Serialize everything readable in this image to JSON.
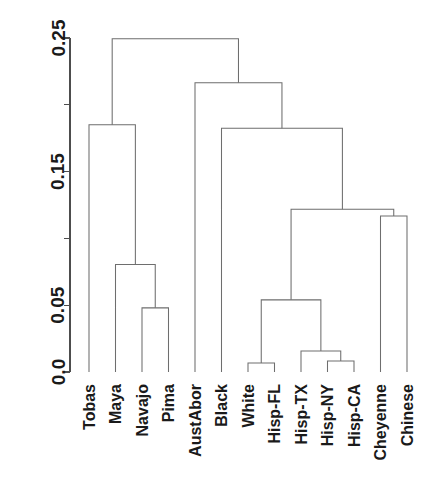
{
  "chart_data": {
    "type": "dendrogram",
    "title": "",
    "xlabel": "",
    "ylabel": "",
    "ylim": [
      0.0,
      0.25
    ],
    "grid": false,
    "legend": null,
    "orientation": "vertical",
    "y_ticks": [
      {
        "value": 0.0,
        "label": "0.0"
      },
      {
        "value": 0.05,
        "label": "0.05"
      },
      {
        "value": 0.1,
        "label": ""
      },
      {
        "value": 0.15,
        "label": "0.15"
      },
      {
        "value": 0.2,
        "label": ""
      },
      {
        "value": 0.25,
        "label": "0.25"
      }
    ],
    "tick_labels": [
      "0.0",
      "0.05",
      "0.15",
      "0.25"
    ],
    "leaves": [
      {
        "index": 0,
        "label": "Tobas"
      },
      {
        "index": 1,
        "label": "Maya"
      },
      {
        "index": 2,
        "label": "Navajo"
      },
      {
        "index": 3,
        "label": "Pima"
      },
      {
        "index": 4,
        "label": "AustAbor"
      },
      {
        "index": 5,
        "label": "Black"
      },
      {
        "index": 6,
        "label": "White"
      },
      {
        "index": 7,
        "label": "Hisp-FL"
      },
      {
        "index": 8,
        "label": "Hisp-TX"
      },
      {
        "index": 9,
        "label": "Hisp-NY"
      },
      {
        "index": 10,
        "label": "Hisp-CA"
      },
      {
        "index": 11,
        "label": "Cheyenne"
      },
      {
        "index": 12,
        "label": "Chinese"
      }
    ],
    "merges": [
      {
        "id": "m1",
        "left": "Navajo",
        "right": "Pima",
        "height": 0.048
      },
      {
        "id": "m2",
        "left": "Maya",
        "right": "m1",
        "height": 0.0805
      },
      {
        "id": "m3",
        "left": "Tobas",
        "right": "m2",
        "height": 0.185
      },
      {
        "id": "m4",
        "left": "White",
        "right": "Hisp-FL",
        "height": 0.0067
      },
      {
        "id": "m5",
        "left": "Hisp-NY",
        "right": "Hisp-CA",
        "height": 0.0082
      },
      {
        "id": "m6",
        "left": "Hisp-TX",
        "right": "m5",
        "height": 0.0157
      },
      {
        "id": "m7",
        "left": "m4",
        "right": "m6",
        "height": 0.054
      },
      {
        "id": "m8",
        "left": "Cheyenne",
        "right": "Chinese",
        "height": 0.1168
      },
      {
        "id": "m9",
        "left": "m7",
        "right": "m8",
        "height": 0.1218
      },
      {
        "id": "m10",
        "left": "Black",
        "right": "m9",
        "height": 0.1825
      },
      {
        "id": "m11",
        "left": "AustAbor",
        "right": "m10",
        "height": 0.2165
      },
      {
        "id": "m12",
        "left": "m3",
        "right": "m11",
        "height": 0.2495
      }
    ]
  },
  "axis": {
    "tick_0": "0.0",
    "tick_1": "0.05",
    "tick_2": "0.15",
    "tick_3": "0.25"
  }
}
